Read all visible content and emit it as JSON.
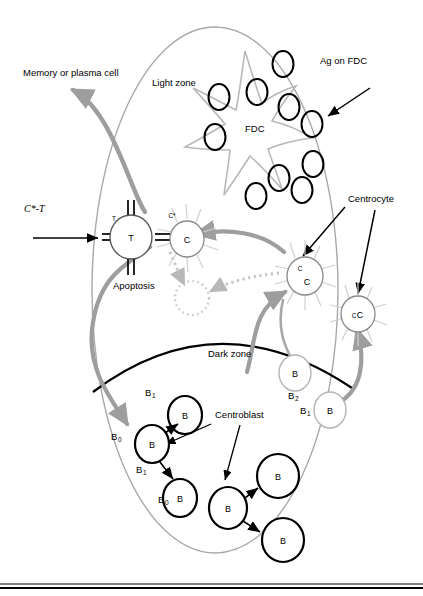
{
  "figure": {
    "colors": {
      "outline_gray": "#a8a8a8",
      "arrow_gray": "#9e9e9e",
      "black": "#000000",
      "dark_zone_line": "#000000",
      "pale_cell": "#b4b4b4"
    }
  },
  "labels": {
    "memory_or_plasma": "Memory or plasma cell",
    "light_zone": "Light zone",
    "ag_on_fdc": "Ag on FDC",
    "fdc": "FDC",
    "centrocyte": "Centrocyte",
    "centroblast": "Centroblast",
    "apoptosis": "Apoptosis",
    "dark_zone": "Dark zone",
    "c_star_t": "C*-T"
  },
  "cells": {
    "t_cell": {
      "glyph": "T",
      "corner_glyph": "T"
    },
    "centrocyte_activated": {
      "glyph": "C",
      "tag": "C*"
    },
    "centrocyte_mid": {
      "glyph": "C",
      "glyph_small": "C"
    },
    "centrocyte_right": {
      "glyph": "C",
      "glyph_small": "C"
    },
    "b_cells": [
      {
        "glyph": "B",
        "tag": "B",
        "tag_sub": "2",
        "style": "pale"
      },
      {
        "glyph": "B",
        "tag": "B",
        "tag_sub": "1",
        "style": "pale"
      },
      {
        "glyph": "B",
        "tag": "B",
        "tag_sub": "0",
        "style": "bold"
      },
      {
        "glyph": "B",
        "tag": "B",
        "tag_sub": "1",
        "style": "bold"
      },
      {
        "glyph": "B",
        "tag": "B",
        "tag_sub": "1",
        "style": "bold"
      },
      {
        "glyph": "B",
        "tag": "B",
        "tag_sub": "0",
        "style": "bold"
      },
      {
        "glyph": "B",
        "style": "bold"
      },
      {
        "glyph": "B",
        "style": "bold"
      },
      {
        "glyph": "B",
        "style": "bold"
      }
    ],
    "antigen_count": 10
  }
}
